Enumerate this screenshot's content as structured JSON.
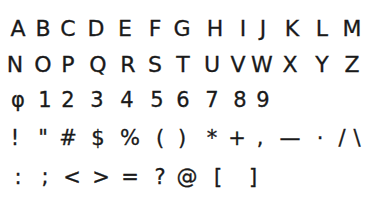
{
  "sheet": {
    "rows": [
      {
        "name": "uppercase-a-m",
        "glyphs": [
          {
            "char": "A",
            "x": 18
          },
          {
            "char": "B",
            "x": 43
          },
          {
            "char": "C",
            "x": 68
          },
          {
            "char": "D",
            "x": 96
          },
          {
            "char": "E",
            "x": 125
          },
          {
            "char": "F",
            "x": 155
          },
          {
            "char": "G",
            "x": 182
          },
          {
            "char": "H",
            "x": 215
          },
          {
            "char": "I",
            "x": 243
          },
          {
            "char": "J",
            "x": 263
          },
          {
            "char": "K",
            "x": 292
          },
          {
            "char": "L",
            "x": 322
          },
          {
            "char": "M",
            "x": 352
          }
        ]
      },
      {
        "name": "uppercase-n-z",
        "glyphs": [
          {
            "char": "N",
            "x": 15
          },
          {
            "char": "O",
            "x": 43
          },
          {
            "char": "P",
            "x": 68
          },
          {
            "char": "Q",
            "x": 98
          },
          {
            "char": "R",
            "x": 128
          },
          {
            "char": "S",
            "x": 155
          },
          {
            "char": "T",
            "x": 183
          },
          {
            "char": "U",
            "x": 212
          },
          {
            "char": "V",
            "x": 238
          },
          {
            "char": "W",
            "x": 262
          },
          {
            "char": "X",
            "x": 290
          },
          {
            "char": "Y",
            "x": 322
          },
          {
            "char": "Z",
            "x": 352
          }
        ]
      },
      {
        "name": "digits",
        "glyphs": [
          {
            "char": "φ",
            "x": 18
          },
          {
            "char": "1",
            "x": 45
          },
          {
            "char": "2",
            "x": 68
          },
          {
            "char": "3",
            "x": 97
          },
          {
            "char": "4",
            "x": 127
          },
          {
            "char": "5",
            "x": 157
          },
          {
            "char": "6",
            "x": 183
          },
          {
            "char": "7",
            "x": 212
          },
          {
            "char": "8",
            "x": 240
          },
          {
            "char": "9",
            "x": 263
          }
        ]
      },
      {
        "name": "punctuation-1",
        "glyphs": [
          {
            "char": "!",
            "x": 15
          },
          {
            "char": "\"",
            "x": 43
          },
          {
            "char": "#",
            "x": 68
          },
          {
            "char": "$",
            "x": 98
          },
          {
            "char": "%",
            "x": 130
          },
          {
            "char": "(",
            "x": 160
          },
          {
            "char": ")",
            "x": 182
          },
          {
            "char": "*",
            "x": 212
          },
          {
            "char": "+",
            "x": 237
          },
          {
            "char": ",",
            "x": 260
          },
          {
            "char": "—",
            "x": 290
          },
          {
            "char": "·",
            "x": 320
          },
          {
            "char": "/",
            "x": 342
          },
          {
            "char": "\\",
            "x": 357
          }
        ]
      },
      {
        "name": "punctuation-2",
        "glyphs": [
          {
            "char": ":",
            "x": 18
          },
          {
            "char": ";",
            "x": 45
          },
          {
            "char": "<",
            "x": 72
          },
          {
            "char": ">",
            "x": 101
          },
          {
            "char": "=",
            "x": 130
          },
          {
            "char": "?",
            "x": 160
          },
          {
            "char": "@",
            "x": 187
          },
          {
            "char": "[",
            "x": 218
          },
          {
            "char": "]",
            "x": 253
          }
        ]
      }
    ]
  }
}
